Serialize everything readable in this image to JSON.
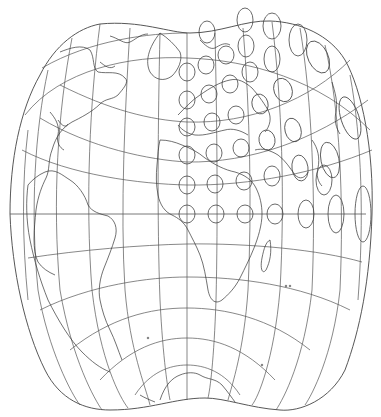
{
  "map": {
    "title": "",
    "type": "world map projection with Tissot indicatrices",
    "colors": {
      "background": "#ffffff",
      "graticule": "#555555",
      "coastline": "#333333",
      "tissot": "#444444"
    },
    "layers": [
      "outline",
      "graticule",
      "equator",
      "coastlines",
      "tissot-indicatrices"
    ],
    "equator_y": 214,
    "central_meridian_x": 187,
    "tissot_grid": {
      "rows_y": [
        42,
        72,
        100,
        128,
        155,
        185,
        214
      ],
      "equator_row": [
        {
          "cx": 187,
          "rx": 8,
          "ry": 9
        },
        {
          "cx": 216,
          "rx": 8,
          "ry": 9
        },
        {
          "cx": 245,
          "rx": 8,
          "ry": 9
        },
        {
          "cx": 275,
          "rx": 8,
          "ry": 11
        },
        {
          "cx": 306,
          "rx": 8,
          "ry": 14
        },
        {
          "cx": 336,
          "rx": 8,
          "ry": 19
        },
        {
          "cx": 363,
          "rx": 8,
          "ry": 28
        }
      ]
    },
    "text_labels": []
  }
}
